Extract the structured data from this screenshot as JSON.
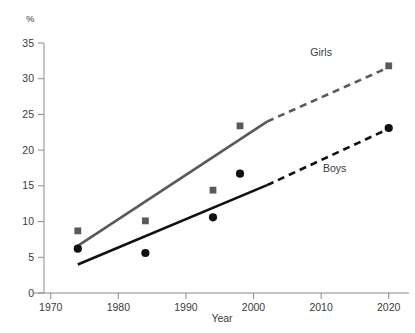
{
  "chart_data": {
    "type": "scatter",
    "title": "",
    "subtitle": "",
    "xlabel": "Year",
    "ylabel": "",
    "unit_label": "%",
    "xlim": [
      1969,
      2023
    ],
    "ylim": [
      0,
      35
    ],
    "xticks": [
      1970,
      1980,
      1990,
      2000,
      2010,
      2020
    ],
    "xtick_labels": [
      "1970",
      "1980",
      "1990",
      "2000",
      "2010",
      "2020"
    ],
    "yticks": [
      0,
      5,
      10,
      15,
      20,
      25,
      30,
      35
    ],
    "ytick_labels": [
      "0",
      "5",
      "10",
      "15",
      "20",
      "25",
      "30",
      "35"
    ],
    "grid": false,
    "legend_position": "inline-annotation",
    "series": [
      {
        "name": "Girls",
        "label": "Girls",
        "color": "#5a5a5a",
        "marker": "square",
        "x": [
          1974,
          1984,
          1994,
          1998,
          2020
        ],
        "values": [
          8.7,
          10.1,
          14.4,
          23.4,
          31.8
        ],
        "trend_solid": {
          "x": [
            1974,
            2002
          ],
          "y": [
            6.6,
            24.0
          ]
        },
        "trend_dashed": {
          "x": [
            2002,
            2020
          ],
          "y": [
            24.0,
            31.6
          ]
        },
        "label_x": 2010,
        "label_y": 33.2
      },
      {
        "name": "Boys",
        "label": "Boys",
        "color": "#111111",
        "marker": "circle",
        "x": [
          1974,
          1984,
          1994,
          1998,
          2020
        ],
        "values": [
          6.2,
          5.6,
          10.6,
          16.7,
          23.1
        ],
        "trend_solid": {
          "x": [
            1974,
            2002
          ],
          "y": [
            4.0,
            15.1
          ]
        },
        "trend_dashed": {
          "x": [
            2002,
            2020
          ],
          "y": [
            15.1,
            23.0
          ]
        },
        "label_x": 2012,
        "label_y": 17.0
      }
    ],
    "axis_color": "#8a8a8a"
  }
}
